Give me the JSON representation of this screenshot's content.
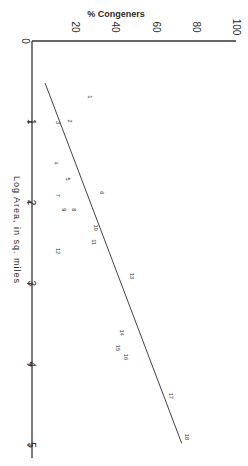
{
  "chart_data": {
    "type": "scatter",
    "orientation": "rotated 90deg (log area runs vertically downward, % congeners horizontally)",
    "title": "",
    "xlabel": "Log Area, in sq. miles",
    "ylabel": "% Congeners",
    "xlim": [
      0,
      5
    ],
    "ylim": [
      0,
      100
    ],
    "x_ticks": [
      "1",
      "2",
      "3",
      "4",
      "5"
    ],
    "y_ticks": [
      "0",
      "20",
      "40",
      "60",
      "80",
      "100"
    ],
    "grid": false,
    "legend": null,
    "points": [
      {
        "label": "1",
        "x": 0.69,
        "y": 28
      },
      {
        "label": "2",
        "x": 0.99,
        "y": 18
      },
      {
        "label": "3",
        "x": 1.01,
        "y": 12
      },
      {
        "label": "4",
        "x": 1.51,
        "y": 11
      },
      {
        "label": "5",
        "x": 1.71,
        "y": 17
      },
      {
        "label": "6",
        "x": 1.88,
        "y": 34
      },
      {
        "label": "7",
        "x": 1.91,
        "y": 12
      },
      {
        "label": "8",
        "x": 2.09,
        "y": 20
      },
      {
        "label": "9",
        "x": 2.09,
        "y": 15
      },
      {
        "label": "10",
        "x": 2.31,
        "y": 31
      },
      {
        "label": "11",
        "x": 2.49,
        "y": 30
      },
      {
        "label": "12",
        "x": 2.6,
        "y": 12
      },
      {
        "label": "13",
        "x": 2.91,
        "y": 49
      },
      {
        "label": "14",
        "x": 3.61,
        "y": 44
      },
      {
        "label": "15",
        "x": 3.8,
        "y": 42
      },
      {
        "label": "16",
        "x": 3.91,
        "y": 46
      },
      {
        "label": "17",
        "x": 4.39,
        "y": 68
      },
      {
        "label": "18",
        "x": 4.9,
        "y": 76
      }
    ],
    "regression_line": {
      "x": [
        0.52,
        4.98
      ],
      "y": [
        6.5,
        74.5
      ]
    }
  },
  "axes": {
    "y_title": "% Congeners",
    "x_title": "Log Area, in sq. miles"
  }
}
